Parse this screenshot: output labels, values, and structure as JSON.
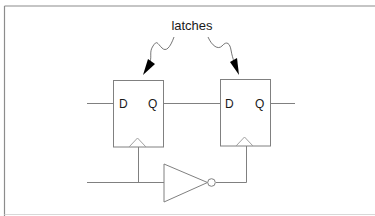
{
  "diagram": {
    "title_label": "latches",
    "latches": [
      {
        "name": "latch-1",
        "d_label": "D",
        "q_label": "Q"
      },
      {
        "name": "latch-2",
        "d_label": "D",
        "q_label": "Q"
      }
    ],
    "components": [
      "latch-1",
      "latch-2",
      "inverter"
    ],
    "colors": {
      "line": "#808080",
      "text": "#1a1a1a",
      "frame": "#8c8c8c",
      "arrow": "#000000"
    }
  }
}
